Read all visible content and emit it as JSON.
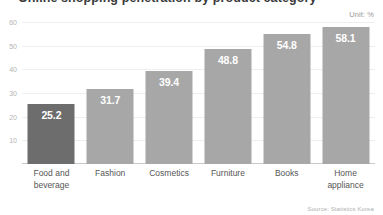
{
  "chart": {
    "title": "Online shopping penetration by product category",
    "unit_note": "Unit: %",
    "source_note": "Source: Statistics Korea"
  },
  "chart_data": {
    "type": "bar",
    "title": "Online shopping penetration by product category",
    "xlabel": "",
    "ylabel": "",
    "unit": "%",
    "ylim": [
      0,
      60
    ],
    "yticks": [
      10,
      20,
      30,
      40,
      50,
      60
    ],
    "ytick_labels": [
      "10",
      "20",
      "30",
      "40",
      "50",
      "60"
    ],
    "grid": true,
    "legend": "none",
    "source": "Source: Statistics Korea",
    "annotation": "Unit: %",
    "highlight_index": 0,
    "colors": {
      "bar": "#a7a7a7",
      "bar_highlight": "#6d6d6d",
      "value_label": "#ffffff",
      "gridline": "#eeeeee",
      "axis": "#c9c9c9",
      "tick_label": "#b4b4b4",
      "category_label": "#555555"
    },
    "categories": [
      "Food and beverage",
      "Fashion",
      "Cosmetics",
      "Furniture",
      "Books",
      "Home appliance"
    ],
    "category_lines": [
      [
        "Food and",
        "beverage"
      ],
      [
        "Fashion"
      ],
      [
        "Cosmetics"
      ],
      [
        "Furniture"
      ],
      [
        "Books"
      ],
      [
        "Home",
        "appliance"
      ]
    ],
    "values": [
      25.2,
      31.7,
      39.4,
      48.8,
      54.8,
      58.1
    ],
    "value_labels": [
      "25.2",
      "31.7",
      "39.4",
      "48.8",
      "54.8",
      "58.1"
    ]
  }
}
